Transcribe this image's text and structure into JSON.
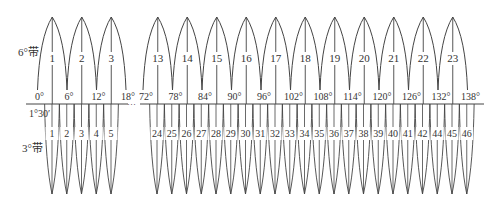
{
  "labels": {
    "six_degree_band": "6°带",
    "three_degree_band": "3°带",
    "three_degree_start": "1°30′",
    "ellipsis": "···"
  },
  "colors": {
    "line": "#444444",
    "text": "#333333",
    "background": "#ffffff"
  },
  "six_degree_zones": {
    "left": [
      {
        "number": "1"
      },
      {
        "number": "2"
      },
      {
        "number": "3"
      }
    ],
    "right": [
      {
        "number": "13"
      },
      {
        "number": "14"
      },
      {
        "number": "15"
      },
      {
        "number": "16"
      },
      {
        "number": "17"
      },
      {
        "number": "18"
      },
      {
        "number": "19"
      },
      {
        "number": "20"
      },
      {
        "number": "21"
      },
      {
        "number": "22"
      },
      {
        "number": "23"
      }
    ]
  },
  "six_degree_boundaries": {
    "left": [
      "0°",
      "6°",
      "12°",
      "18°"
    ],
    "right": [
      "72°",
      "78°",
      "84°",
      "90°",
      "96°",
      "102°",
      "108°",
      "114°",
      "120°",
      "126°",
      "132°",
      "138°"
    ]
  },
  "three_degree_zones": {
    "left": [
      "1",
      "2",
      "3",
      "4",
      "5"
    ],
    "right": [
      "24",
      "25",
      "26",
      "27",
      "28",
      "29",
      "30",
      "31",
      "32",
      "33",
      "34",
      "35",
      "36",
      "37",
      "38",
      "39",
      "40",
      "41",
      "42",
      "44",
      "45",
      "46"
    ]
  }
}
